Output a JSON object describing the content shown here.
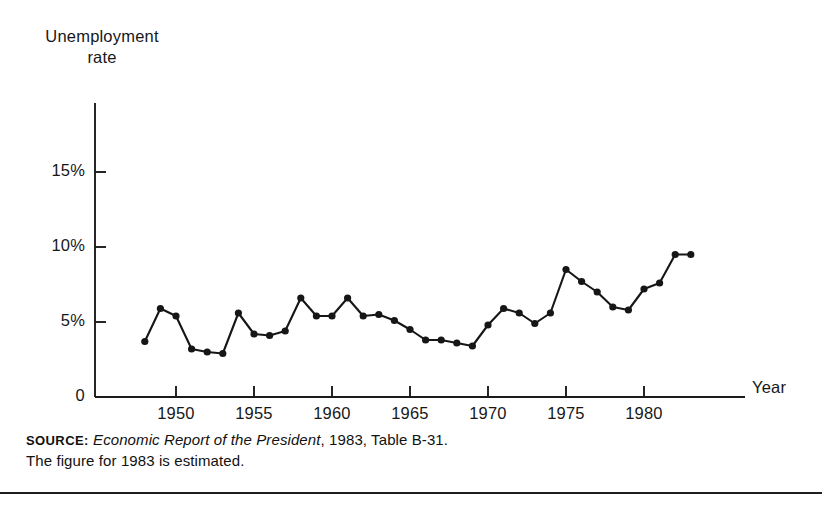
{
  "chart_data": {
    "type": "line",
    "title": "",
    "ylabel": "Unemployment\nrate",
    "xlabel": "Year",
    "x": [
      1948,
      1949,
      1950,
      1951,
      1952,
      1953,
      1954,
      1955,
      1956,
      1957,
      1958,
      1959,
      1960,
      1961,
      1962,
      1963,
      1964,
      1965,
      1966,
      1967,
      1968,
      1969,
      1970,
      1971,
      1972,
      1973,
      1974,
      1975,
      1976,
      1977,
      1978,
      1979,
      1980,
      1981,
      1982,
      1983
    ],
    "values": [
      3.7,
      5.9,
      5.4,
      3.2,
      3.0,
      2.9,
      5.6,
      4.2,
      4.1,
      4.4,
      6.6,
      5.4,
      5.4,
      6.6,
      5.4,
      5.5,
      5.1,
      4.5,
      3.8,
      3.8,
      3.6,
      3.4,
      4.8,
      5.9,
      5.6,
      4.9,
      5.6,
      8.5,
      7.7,
      7.0,
      6.0,
      5.8,
      7.2,
      7.6,
      9.5,
      9.5
    ],
    "xlim": [
      1947.4,
      1983.8
    ],
    "ylim": [
      0,
      16.5
    ],
    "xticks": [
      1950,
      1955,
      1960,
      1965,
      1970,
      1975,
      1980
    ],
    "xticklabels": [
      "1950",
      "1955",
      "1960",
      "1965",
      "1970",
      "1975",
      "1980"
    ],
    "yticks": [
      0,
      5,
      10,
      15
    ],
    "yticklabels": [
      "0",
      "5%",
      "10%",
      "15%"
    ],
    "grid": false,
    "legend": false,
    "marker": "filled-circle",
    "line_color": "#161616",
    "marker_color": "#161616"
  },
  "source_note": {
    "keyword": "SOURCE:",
    "publication": "Economic Report of the President",
    "citation": ", 1983, Table B-31.",
    "line2": "The figure for 1983 is estimated."
  }
}
